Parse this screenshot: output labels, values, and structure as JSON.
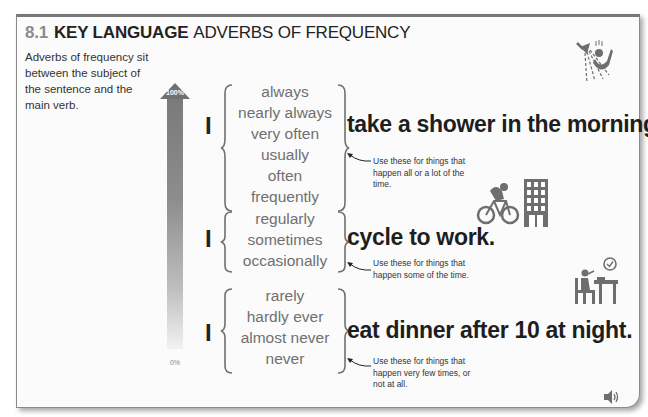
{
  "title": {
    "number": "8.1",
    "key": "KEY LANGUAGE",
    "subtitle": "ADVERBS OF FREQUENCY"
  },
  "intro": "Adverbs of frequency sit between the subject of the sentence and the main verb.",
  "scale": {
    "top_label": "100%",
    "bottom_label": "0%"
  },
  "groups": [
    {
      "pronoun": "I",
      "adverbs": [
        "always",
        "nearly always",
        "very often",
        "usually",
        "often",
        "frequently"
      ],
      "phrase": "take a shower in the morning.",
      "note": "Use these for things that happen all or a lot of the time.",
      "icon": "shower-icon"
    },
    {
      "pronoun": "I",
      "adverbs": [
        "regularly",
        "sometimes",
        "occasionally"
      ],
      "phrase": "cycle to work.",
      "note": "Use these for things that happen some of the time.",
      "icon": "cyclist-office-icon"
    },
    {
      "pronoun": "I",
      "adverbs": [
        "rarely",
        "hardly ever",
        "almost never",
        "never"
      ],
      "phrase": "eat dinner after 10 at night.",
      "note": "Use these for things that happen very few times, or not at all.",
      "icon": "late-dinner-icon"
    }
  ],
  "audio": {
    "icon": "speaker-icon"
  },
  "colors": {
    "title_number": "#8c8c8c",
    "text": "#222222",
    "adverb": "#707070",
    "icon": "#6e6e6e"
  }
}
